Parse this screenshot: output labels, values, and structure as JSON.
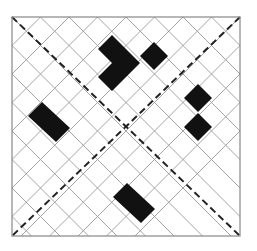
{
  "diagram": {
    "type": "diamond-grid-pattern",
    "frame": {
      "x": 12,
      "y": 17,
      "width": 228,
      "height": 219,
      "stroke": "#888888"
    },
    "grid": {
      "spacing": 28.5,
      "stroke": "#9a9a9a"
    },
    "diagonals": [
      {
        "name": "main-diagonal",
        "x1": 12,
        "y1": 17,
        "x2": 240,
        "y2": 236,
        "style": "dashed"
      },
      {
        "name": "anti-diagonal",
        "x1": 240,
        "y1": 17,
        "x2": 12,
        "y2": 236,
        "style": "dashed"
      }
    ],
    "fill_color": "#111111",
    "filled_regions": [
      {
        "name": "top-cluster-block",
        "points": "112,35 126,49 126,49 140,63 126,77 112,91 98,77 112,63 98,49"
      },
      {
        "name": "top-single-diamond",
        "points": "154,42 168,56 154,70 140,56"
      },
      {
        "name": "right-upper-diamond",
        "points": "198,84 212,98 198,112 184,98"
      },
      {
        "name": "right-lower-diamond",
        "points": "198,113 212,127 198,141 184,127"
      },
      {
        "name": "left-bar",
        "points": "42,102 70,128 56,142 28,116"
      },
      {
        "name": "bottom-bar",
        "points": "127,183 155,209 141,223 113,197"
      }
    ]
  }
}
